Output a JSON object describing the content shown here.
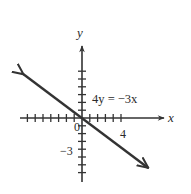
{
  "header_fragment": "",
  "chart_data": {
    "type": "line",
    "title": "",
    "equation": "4y = −3x",
    "slope": -0.75,
    "intercept": 0,
    "x": [
      -7.5,
      8.5
    ],
    "y": [
      5.6,
      -6.4
    ],
    "xlabel": "x",
    "ylabel": "y",
    "origin_label": "0",
    "x_tick_labels": [
      {
        "value": 4,
        "label": "4"
      }
    ],
    "y_tick_labels": [
      {
        "value": -3,
        "label": "−3"
      }
    ],
    "xlim": [
      -8,
      10
    ],
    "ylim": [
      -8,
      9
    ],
    "x_ticks": [
      -7,
      -6,
      -5,
      -4,
      -3,
      -2,
      -1,
      1,
      2,
      3,
      4,
      5
    ],
    "y_ticks": [
      -7,
      -6,
      -5,
      -4,
      -3,
      -2,
      -1,
      1,
      2,
      3,
      4,
      5,
      6
    ],
    "grid": false,
    "legend": null,
    "line_color": "#333333",
    "axis_color": "#333333"
  }
}
